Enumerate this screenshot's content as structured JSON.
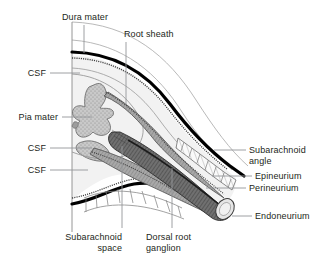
{
  "figure": {
    "background_color": "#ffffff",
    "text_color": "#231f20",
    "leader_color": "#939598",
    "outline_color": "#58595b",
    "dura_color": "#000000",
    "interior_color": "#f2f2f2",
    "gray_matter_color": "#b3b3b3",
    "nerve_fiber_color": "#6b6b6b",
    "cut_face_color": "#e6e6e6"
  },
  "labels": {
    "dura_mater": "Dura mater",
    "root_sheath": "Root sheath",
    "csf_upper": "CSF",
    "pia_mater": "Pia mater",
    "csf_middle": "CSF",
    "csf_lower": "CSF",
    "subarachnoid_angle_line1": "Subarachnoid",
    "subarachnoid_angle_line2": "angle",
    "epineurium": "Epineurium",
    "perineurium": "Perineurium",
    "endoneurium": "Endoneurium",
    "subarachnoid_space_line1": "Subarachnoid",
    "subarachnoid_space_line2": "space",
    "dorsal_root_ganglion_line1": "Dorsal root",
    "dorsal_root_ganglion_line2": "ganglion"
  }
}
